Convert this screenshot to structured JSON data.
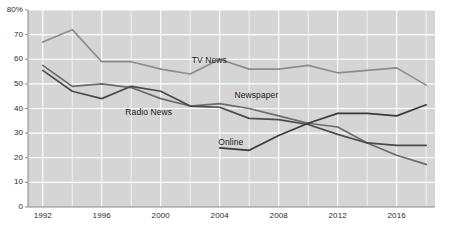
{
  "chart_data": {
    "type": "line",
    "title": "",
    "subtitle": "",
    "xlabel": "",
    "ylabel": "",
    "x": [
      1992,
      1994,
      1996,
      1998,
      2000,
      2002,
      2004,
      2006,
      2008,
      2010,
      2012,
      2014,
      2016,
      2018
    ],
    "xlim": [
      1991,
      2018.6
    ],
    "ylim": [
      0,
      80
    ],
    "xticks": [
      1992,
      1996,
      2000,
      2004,
      2008,
      2012,
      2016
    ],
    "xtick_labels": [
      "1992",
      "1996",
      "2000",
      "2004",
      "2008",
      "2012",
      "2016"
    ],
    "yticks": [
      0,
      10,
      20,
      30,
      40,
      50,
      60,
      70,
      80
    ],
    "ytick_labels": [
      "0",
      "10",
      "20",
      "30",
      "40",
      "50",
      "60",
      "70",
      "80%"
    ],
    "grid": true,
    "grid_color": "#ffffff",
    "plot_background": "#d5d5d5",
    "legend": "inline-annotations",
    "series": [
      {
        "name": "TV News",
        "color": "#8c8c8c",
        "label_x": 2002.1,
        "label_y": 59.5,
        "x": [
          1992,
          1994,
          1996,
          1998,
          2000,
          2002,
          2004,
          2006,
          2008,
          2010,
          2012,
          2014,
          2016,
          2018
        ],
        "values": [
          67,
          72,
          59,
          59,
          56,
          54,
          60,
          56,
          56,
          57.5,
          54.5,
          55.5,
          56.5,
          49.5
        ]
      },
      {
        "name": "Newspaper",
        "color": "#6b6b6b",
        "label_x": 2005.0,
        "label_y": 45.5,
        "x": [
          1992,
          1994,
          1996,
          1998,
          2000,
          2002,
          2004,
          2006,
          2008,
          2010,
          2012,
          2014,
          2016,
          2018
        ],
        "values": [
          57.5,
          49,
          50,
          48.5,
          44,
          41,
          42,
          40,
          37,
          34,
          32.5,
          26,
          21,
          17.3
        ]
      },
      {
        "name": "Radio News",
        "color": "#4a4a4a",
        "label_x": 1997.6,
        "label_y": 38.6,
        "x": [
          1992,
          1994,
          1996,
          1998,
          2000,
          2002,
          2004,
          2006,
          2008,
          2010,
          2012,
          2014,
          2016,
          2018
        ],
        "values": [
          55.5,
          47,
          44,
          49,
          47,
          41,
          40.5,
          36,
          35.5,
          33.5,
          29.5,
          26,
          25,
          25
        ]
      },
      {
        "name": "Online",
        "color": "#3a3a3a",
        "label_x": 2003.9,
        "label_y": 26.4,
        "x": [
          2004,
          2006,
          2008,
          2010,
          2012,
          2014,
          2016,
          2018
        ],
        "values": [
          24,
          23,
          29,
          34,
          38,
          38,
          37,
          41.5
        ]
      }
    ]
  },
  "footer": {
    "source": ""
  }
}
